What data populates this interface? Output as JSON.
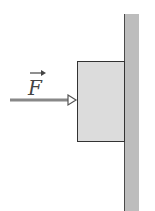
{
  "diagram": {
    "force_label": "F",
    "force_symbol": "vector-arrow-over-F",
    "elements": [
      {
        "name": "wall",
        "type": "vertical-wall"
      },
      {
        "name": "block",
        "type": "box-pressed-against-wall"
      },
      {
        "name": "force-arrow",
        "type": "horizontal-arrow",
        "direction": "right"
      }
    ],
    "colors": {
      "wall": "#bdbdbd",
      "block": "#dcdcdc",
      "outline": "#333333",
      "arrow": "#888888"
    }
  }
}
